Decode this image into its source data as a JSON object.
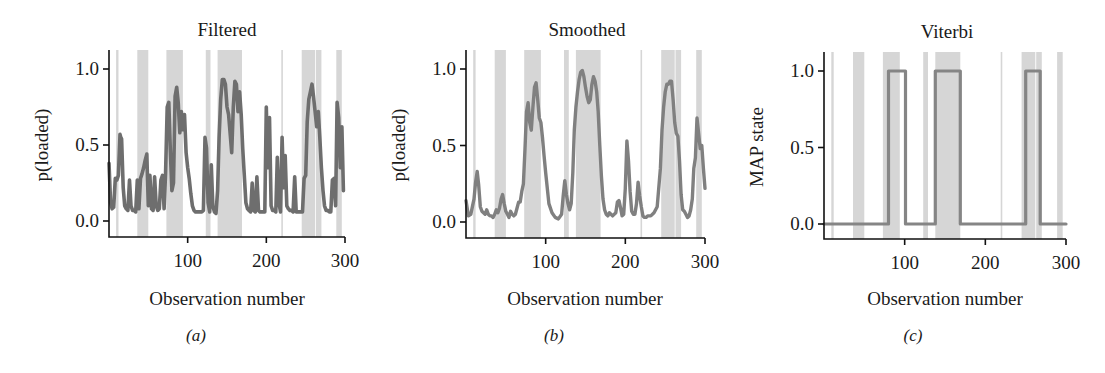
{
  "chart_data": [
    {
      "id": "a",
      "type": "line",
      "title": "Filtered",
      "xlabel": "Observation number",
      "ylabel": "p(loaded)",
      "caption": "(a)",
      "xlim": [
        0,
        300
      ],
      "ylim": [
        -0.1,
        1.1
      ],
      "xticks": [
        100,
        200,
        300
      ],
      "xtick_labels": [
        "100",
        "200",
        "300"
      ],
      "yticks": [
        0.0,
        0.5,
        1.0
      ],
      "ytick_labels": [
        "0.0",
        "0.5",
        "1.0"
      ],
      "grid": false,
      "line_color": "#6e6e6e",
      "shade_color": "#d4d4d4",
      "shaded_regions": [
        [
          9,
          12
        ],
        [
          36,
          50
        ],
        [
          73,
          94
        ],
        [
          123,
          129
        ],
        [
          138,
          169
        ],
        [
          219,
          221
        ],
        [
          245,
          262
        ],
        [
          263,
          270
        ],
        [
          289,
          296
        ]
      ],
      "x": [
        0,
        2,
        4,
        6,
        8,
        10,
        12,
        14,
        15,
        16,
        18,
        20,
        22,
        24,
        26,
        28,
        30,
        32,
        34,
        36,
        38,
        40,
        42,
        44,
        46,
        48,
        50,
        52,
        54,
        56,
        58,
        60,
        62,
        64,
        66,
        68,
        70,
        72,
        74,
        76,
        78,
        80,
        82,
        84,
        86,
        88,
        90,
        92,
        94,
        96,
        98,
        100,
        102,
        104,
        106,
        108,
        110,
        112,
        114,
        116,
        118,
        120,
        122,
        124,
        126,
        128,
        130,
        132,
        134,
        136,
        138,
        140,
        142,
        144,
        146,
        148,
        150,
        152,
        154,
        156,
        158,
        160,
        162,
        164,
        166,
        168,
        170,
        172,
        174,
        176,
        178,
        180,
        182,
        184,
        186,
        188,
        190,
        192,
        194,
        196,
        198,
        200,
        202,
        204,
        206,
        208,
        210,
        212,
        214,
        216,
        218,
        220,
        222,
        224,
        226,
        228,
        230,
        232,
        234,
        236,
        238,
        240,
        242,
        244,
        246,
        248,
        250,
        252,
        254,
        256,
        258,
        260,
        262,
        264,
        266,
        268,
        270,
        272,
        274,
        276,
        278,
        280,
        282,
        284,
        286,
        288,
        290,
        292,
        294,
        296,
        298,
        300
      ],
      "values": [
        0.38,
        0.12,
        0.08,
        0.09,
        0.28,
        0.27,
        0.3,
        0.57,
        0.55,
        0.54,
        0.22,
        0.1,
        0.08,
        0.07,
        0.27,
        0.1,
        0.07,
        0.07,
        0.06,
        0.27,
        0.08,
        0.28,
        0.31,
        0.35,
        0.4,
        0.44,
        0.1,
        0.3,
        0.08,
        0.07,
        0.29,
        0.1,
        0.07,
        0.08,
        0.27,
        0.3,
        0.08,
        0.32,
        0.75,
        0.78,
        0.45,
        0.2,
        0.25,
        0.82,
        0.88,
        0.78,
        0.58,
        0.72,
        0.6,
        0.7,
        0.45,
        0.35,
        0.28,
        0.18,
        0.1,
        0.07,
        0.06,
        0.06,
        0.06,
        0.06,
        0.06,
        0.07,
        0.55,
        0.48,
        0.12,
        0.06,
        0.37,
        0.1,
        0.06,
        0.05,
        0.2,
        0.55,
        0.8,
        0.93,
        0.93,
        0.9,
        0.75,
        0.7,
        0.58,
        0.45,
        0.75,
        0.92,
        0.9,
        0.72,
        0.85,
        0.7,
        0.48,
        0.3,
        0.12,
        0.08,
        0.07,
        0.06,
        0.25,
        0.07,
        0.06,
        0.29,
        0.07,
        0.06,
        0.06,
        0.06,
        0.06,
        0.75,
        0.35,
        0.68,
        0.1,
        0.07,
        0.07,
        0.06,
        0.42,
        0.12,
        0.06,
        0.55,
        0.22,
        0.43,
        0.1,
        0.08,
        0.07,
        0.07,
        0.06,
        0.29,
        0.06,
        0.06,
        0.06,
        0.06,
        0.06,
        0.28,
        0.3,
        0.65,
        0.8,
        0.85,
        0.9,
        0.82,
        0.72,
        0.62,
        0.72,
        0.55,
        0.35,
        0.2,
        0.1,
        0.07,
        0.07,
        0.06,
        0.06,
        0.27,
        0.28,
        0.1,
        0.78,
        0.68,
        0.35,
        0.62,
        0.2
      ]
    },
    {
      "id": "b",
      "type": "line",
      "title": "Smoothed",
      "xlabel": "Observation number",
      "ylabel": "p(loaded)",
      "caption": "(b)",
      "xlim": [
        0,
        300
      ],
      "ylim": [
        -0.1,
        1.1
      ],
      "xticks": [
        100,
        200,
        300
      ],
      "xtick_labels": [
        "100",
        "200",
        "300"
      ],
      "yticks": [
        0.0,
        0.5,
        1.0
      ],
      "ytick_labels": [
        "0.0",
        "0.5",
        "1.0"
      ],
      "grid": false,
      "line_color": "#808080",
      "shade_color": "#d4d4d4",
      "shaded_regions": [
        [
          9,
          12
        ],
        [
          36,
          50
        ],
        [
          73,
          94
        ],
        [
          123,
          129
        ],
        [
          138,
          169
        ],
        [
          219,
          221
        ],
        [
          245,
          262
        ],
        [
          263,
          270
        ],
        [
          289,
          296
        ]
      ],
      "x": [
        0,
        3,
        6,
        8,
        10,
        12,
        14,
        16,
        18,
        20,
        22,
        24,
        26,
        28,
        30,
        32,
        34,
        36,
        38,
        40,
        42,
        44,
        46,
        48,
        50,
        52,
        54,
        56,
        58,
        60,
        62,
        64,
        66,
        68,
        70,
        72,
        74,
        76,
        78,
        80,
        82,
        84,
        86,
        88,
        90,
        92,
        94,
        96,
        98,
        100,
        104,
        108,
        112,
        116,
        120,
        122,
        124,
        126,
        128,
        130,
        132,
        134,
        136,
        138,
        140,
        142,
        144,
        146,
        148,
        150,
        152,
        154,
        156,
        158,
        160,
        162,
        164,
        166,
        168,
        170,
        172,
        174,
        176,
        178,
        180,
        184,
        188,
        190,
        192,
        194,
        196,
        198,
        200,
        202,
        204,
        206,
        208,
        210,
        212,
        214,
        216,
        218,
        220,
        222,
        224,
        226,
        228,
        232,
        236,
        240,
        244,
        246,
        248,
        250,
        252,
        254,
        256,
        258,
        260,
        262,
        264,
        266,
        268,
        270,
        272,
        274,
        276,
        278,
        280,
        282,
        284,
        286,
        288,
        290,
        292,
        294,
        296,
        298,
        300
      ],
      "values": [
        0.14,
        0.04,
        0.05,
        0.1,
        0.15,
        0.26,
        0.33,
        0.24,
        0.1,
        0.07,
        0.06,
        0.05,
        0.08,
        0.05,
        0.04,
        0.04,
        0.03,
        0.05,
        0.08,
        0.06,
        0.09,
        0.15,
        0.18,
        0.12,
        0.07,
        0.05,
        0.03,
        0.07,
        0.05,
        0.04,
        0.05,
        0.09,
        0.13,
        0.13,
        0.2,
        0.25,
        0.48,
        0.72,
        0.78,
        0.65,
        0.6,
        0.75,
        0.88,
        0.91,
        0.8,
        0.68,
        0.65,
        0.55,
        0.43,
        0.32,
        0.12,
        0.06,
        0.03,
        0.02,
        0.05,
        0.17,
        0.27,
        0.18,
        0.12,
        0.08,
        0.12,
        0.32,
        0.6,
        0.75,
        0.85,
        0.93,
        0.98,
        0.99,
        0.95,
        0.88,
        0.82,
        0.78,
        0.8,
        0.9,
        0.95,
        0.92,
        0.85,
        0.72,
        0.5,
        0.3,
        0.15,
        0.08,
        0.05,
        0.04,
        0.06,
        0.04,
        0.06,
        0.13,
        0.14,
        0.09,
        0.04,
        0.05,
        0.22,
        0.53,
        0.4,
        0.2,
        0.07,
        0.05,
        0.05,
        0.12,
        0.26,
        0.17,
        0.1,
        0.04,
        0.03,
        0.03,
        0.04,
        0.04,
        0.06,
        0.1,
        0.35,
        0.6,
        0.75,
        0.85,
        0.9,
        0.9,
        0.92,
        0.92,
        0.8,
        0.65,
        0.58,
        0.56,
        0.4,
        0.18,
        0.08,
        0.07,
        0.05,
        0.03,
        0.04,
        0.08,
        0.15,
        0.35,
        0.42,
        0.68,
        0.58,
        0.48,
        0.5,
        0.35,
        0.22
      ]
    },
    {
      "id": "c",
      "type": "line",
      "title": "Viterbi",
      "xlabel": "Observation number",
      "ylabel": "MAP state",
      "caption": "(c)",
      "xlim": [
        0,
        300
      ],
      "ylim": [
        -0.1,
        1.1
      ],
      "xticks": [
        100,
        200,
        300
      ],
      "xtick_labels": [
        "100",
        "200",
        "300"
      ],
      "yticks": [
        0.0,
        0.5,
        1.0
      ],
      "ytick_labels": [
        "0.0",
        "0.5",
        "1.0"
      ],
      "grid": false,
      "line_color": "#858585",
      "shade_color": "#d4d4d4",
      "shaded_regions": [
        [
          9,
          12
        ],
        [
          36,
          50
        ],
        [
          73,
          94
        ],
        [
          123,
          129
        ],
        [
          138,
          169
        ],
        [
          219,
          221
        ],
        [
          245,
          262
        ],
        [
          263,
          270
        ],
        [
          289,
          296
        ]
      ],
      "step": true,
      "x": [
        0,
        80,
        80,
        101,
        101,
        138,
        138,
        169,
        169,
        250,
        250,
        268,
        268,
        300
      ],
      "values": [
        0,
        0,
        1,
        1,
        0,
        0,
        1,
        1,
        0,
        0,
        1,
        1,
        0,
        0
      ]
    }
  ],
  "panels": [
    {
      "title": "Filtered",
      "ylabel": "p(loaded)",
      "xlabel": "Observation number",
      "caption": "(a)"
    },
    {
      "title": "Smoothed",
      "ylabel": "p(loaded)",
      "xlabel": "Observation number",
      "caption": "(b)"
    },
    {
      "title": "Viterbi",
      "ylabel": "MAP state",
      "xlabel": "Observation number",
      "caption": "(c)"
    }
  ]
}
